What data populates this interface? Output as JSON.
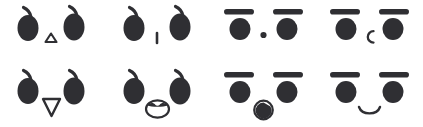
{
  "canvas": {
    "width": 423,
    "height": 127,
    "background_color": "#ffffff",
    "ink_color": "#2f2f33"
  },
  "sheet": {
    "title": "Face expression sheet",
    "rows": 2,
    "columns": 4,
    "face_count": 8
  },
  "faces": [
    {
      "id": "face-1",
      "position": "row-1-col-1",
      "eyes": "teardrop-eyes",
      "eyes_label": "teardrop eyes with upward tails",
      "mouth": "small-triangle-outline",
      "mouth_label": "small upward triangle outline"
    },
    {
      "id": "face-2",
      "position": "row-1-col-2",
      "eyes": "teardrop-eyes",
      "eyes_label": "teardrop eyes with upward tails",
      "mouth": "vertical-line",
      "mouth_label": "short vertical line"
    },
    {
      "id": "face-3",
      "position": "row-1-col-3",
      "eyes": "bar-brow-round-eyes",
      "eyes_label": "round eyes under horizontal brow bars",
      "mouth": "dot",
      "mouth_label": "small round dot"
    },
    {
      "id": "face-4",
      "position": "row-1-col-4",
      "eyes": "bar-brow-round-eyes",
      "eyes_label": "round eyes under horizontal brow bars",
      "mouth": "c-arc",
      "mouth_label": "letter c arc opening right"
    },
    {
      "id": "face-5",
      "position": "row-2-col-1",
      "eyes": "teardrop-eyes",
      "eyes_label": "teardrop eyes with upward tails",
      "mouth": "down-triangle-outline",
      "mouth_label": "downward pointing triangle outline"
    },
    {
      "id": "face-6",
      "position": "row-2-col-2",
      "eyes": "teardrop-eyes",
      "eyes_label": "teardrop eyes with upward tails",
      "mouth": "open-oval-with-lip",
      "mouth_label": "open oval mouth with filled upper lip"
    },
    {
      "id": "face-7",
      "position": "row-2-col-3",
      "eyes": "bar-brow-round-eyes",
      "eyes_label": "round eyes under horizontal brow bars",
      "mouth": "circle-with-filled-crescent",
      "mouth_label": "circle outline filled with crescent"
    },
    {
      "id": "face-8",
      "position": "row-2-col-4",
      "eyes": "bar-brow-round-eyes",
      "eyes_label": "round eyes under horizontal brow bars",
      "mouth": "smile-arc",
      "mouth_label": "upward smiling arc"
    }
  ]
}
